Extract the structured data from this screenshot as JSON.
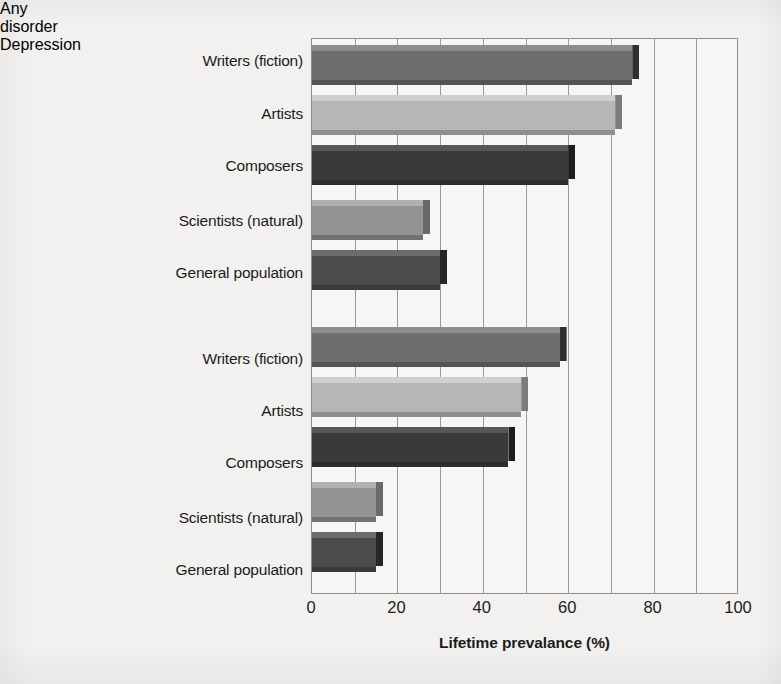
{
  "chart_data": {
    "type": "bar",
    "orientation": "horizontal",
    "title": "",
    "xlabel": "Lifetime prevalance (%)",
    "ylabel": "",
    "xlim": [
      0,
      100
    ],
    "xticks": [
      "0",
      "20",
      "40",
      "60",
      "80",
      "100"
    ],
    "xtick_values": [
      0,
      20,
      40,
      60,
      80,
      100
    ],
    "gridline_interval": 10,
    "grid": true,
    "legend": "none",
    "groups": [
      {
        "name": "Any disorder",
        "categories": [
          "Writers (fiction)",
          "Artists",
          "Composers",
          "Scientists (natural)",
          "General population"
        ],
        "values": [
          75,
          71,
          60,
          26,
          30
        ]
      },
      {
        "name": "Depression",
        "categories": [
          "Writers (fiction)",
          "Artists",
          "Composers",
          "Scientists (natural)",
          "General population"
        ],
        "values": [
          58,
          49,
          46,
          15,
          15
        ]
      }
    ],
    "series_colors": {
      "writers": "#6e6e6e",
      "artists": "#b6b6b6",
      "composers": "#3a3a3a",
      "scientists": "#939393",
      "general_population": "#4b4b4b"
    }
  },
  "figure": {
    "background": "#f2f1ef",
    "plot_background": "#f7f6f4",
    "axis_color": "#8d8d8d",
    "text_color": "#1c1c1c"
  },
  "axis": {
    "title": "Lifetime prevalance (%)",
    "ticks": [
      {
        "label": "0",
        "value": 0
      },
      {
        "label": "20",
        "value": 20
      },
      {
        "label": "40",
        "value": 40
      },
      {
        "label": "60",
        "value": 60
      },
      {
        "label": "80",
        "value": 80
      },
      {
        "label": "100",
        "value": 100
      }
    ]
  },
  "groups": {
    "any_disorder": {
      "line1": "Any",
      "line2": "disorder"
    },
    "depression": {
      "label": "Depression"
    }
  },
  "bars": [
    {
      "id": "any-writers",
      "group": "Any disorder",
      "category": "Writers (fiction)",
      "value": 75,
      "color": "#6e6e6e",
      "top": "#8d8d8d",
      "side": "#2f2f2f"
    },
    {
      "id": "any-artists",
      "group": "Any disorder",
      "category": "Artists",
      "value": 71,
      "color": "#b6b6b6",
      "top": "#cfcfcf",
      "side": "#7c7c7c"
    },
    {
      "id": "any-composers",
      "group": "Any disorder",
      "category": "Composers",
      "value": 60,
      "color": "#3a3a3a",
      "top": "#575757",
      "side": "#1e1e1e"
    },
    {
      "id": "any-scientists",
      "group": "Any disorder",
      "category": "Scientists (natural)",
      "value": 26,
      "color": "#939393",
      "top": "#b0b0b0",
      "side": "#6a6a6a"
    },
    {
      "id": "any-general",
      "group": "Any disorder",
      "category": "General population",
      "value": 30,
      "color": "#4b4b4b",
      "top": "#6b6b6b",
      "side": "#262626"
    },
    {
      "id": "dep-writers",
      "group": "Depression",
      "category": "Writers (fiction)",
      "value": 58,
      "color": "#6e6e6e",
      "top": "#8d8d8d",
      "side": "#2f2f2f"
    },
    {
      "id": "dep-artists",
      "group": "Depression",
      "category": "Artists",
      "value": 49,
      "color": "#b6b6b6",
      "top": "#cfcfcf",
      "side": "#7c7c7c"
    },
    {
      "id": "dep-composers",
      "group": "Depression",
      "category": "Composers",
      "value": 46,
      "color": "#3a3a3a",
      "top": "#575757",
      "side": "#1e1e1e"
    },
    {
      "id": "dep-scientists",
      "group": "Depression",
      "category": "Scientists (natural)",
      "value": 15,
      "color": "#939393",
      "top": "#b0b0b0",
      "side": "#6a6a6a"
    },
    {
      "id": "dep-general",
      "group": "Depression",
      "category": "General population",
      "value": 15,
      "color": "#4b4b4b",
      "top": "#6b6b6b",
      "side": "#262626"
    }
  ],
  "bar_layout": [
    {
      "id": "any-writers",
      "y": 6
    },
    {
      "id": "any-artists",
      "y": 56
    },
    {
      "id": "any-composers",
      "y": 106
    },
    {
      "id": "any-scientists",
      "y": 161
    },
    {
      "id": "any-general",
      "y": 211
    },
    {
      "id": "dep-writers",
      "y": 288
    },
    {
      "id": "dep-artists",
      "y": 338
    },
    {
      "id": "dep-composers",
      "y": 388
    },
    {
      "id": "dep-scientists",
      "y": 443
    },
    {
      "id": "dep-general",
      "y": 493
    }
  ],
  "label_layout": [
    {
      "text": "Writers (fiction)",
      "y": 52
    },
    {
      "text": "Artists",
      "y": 105
    },
    {
      "text": "Composers",
      "y": 157
    },
    {
      "text": "Scientists (natural)",
      "y": 212
    },
    {
      "text": "General population",
      "y": 264
    },
    {
      "text": "Writers (fiction)",
      "y": 350
    },
    {
      "text": "Artists",
      "y": 402
    },
    {
      "text": "Composers",
      "y": 454
    },
    {
      "text": "Scientists (natural)",
      "y": 509
    },
    {
      "text": "General population",
      "y": 561
    }
  ]
}
